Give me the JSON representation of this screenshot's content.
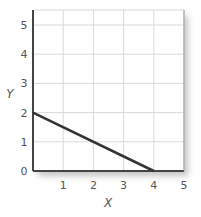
{
  "chart_data": {
    "type": "line",
    "title": "",
    "xlabel": "X",
    "ylabel": "Y",
    "xlim": [
      0,
      5
    ],
    "ylim": [
      0,
      5.5
    ],
    "xticks": [
      1,
      2,
      3,
      4,
      5
    ],
    "yticks": [
      0,
      1,
      2,
      3,
      4,
      5
    ],
    "grid": true,
    "legend": null,
    "series": [
      {
        "name": "line",
        "x": [
          0,
          4
        ],
        "y": [
          2,
          0
        ]
      }
    ]
  },
  "colors": {
    "grid": "#d9d9d9",
    "axis": "#444444",
    "line": "#333333",
    "text": "#555555",
    "shadow": "#bdbdbd"
  }
}
